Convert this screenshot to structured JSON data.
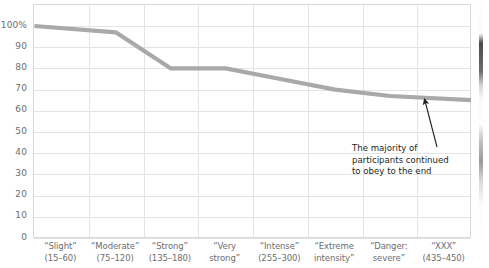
{
  "chart_data": {
    "type": "line",
    "title": "",
    "subtitle": "",
    "xlabel": "",
    "ylabel": "",
    "ylim": [
      0,
      100
    ],
    "grid": true,
    "legend_position": "none",
    "line_color": "#a9a9a9",
    "categories": [
      "“Slight” (15–60)",
      "“Moderate” (75–120)",
      "“Strong” (135–180)",
      "“Very strong”",
      "“Intense” (255–300)",
      "“Extreme intensity”",
      "“Danger: severe”",
      "“XXX” (435–450)"
    ],
    "values": [
      100,
      97,
      80,
      80,
      75,
      70,
      67,
      65
    ],
    "ytick_labels": [
      "100%",
      "90",
      "80",
      "70",
      "60",
      "50",
      "40",
      "30",
      "20",
      "10",
      "0"
    ],
    "ytick_values": [
      100,
      90,
      80,
      70,
      60,
      50,
      40,
      30,
      20,
      10,
      0
    ],
    "annotations": [
      {
        "name": "majority-obeyed-note",
        "lines": [
          "The majority of",
          "participants continued",
          "to obey to the end"
        ],
        "points_to_category": "“XXX” (435–450)",
        "points_to_value": 65
      }
    ]
  },
  "xaxis": {
    "categories": [
      {
        "line1": "“Slight”",
        "line2": "(15–60)"
      },
      {
        "line1": "“Moderate”",
        "line2": "(75–120)"
      },
      {
        "line1": "“Strong”",
        "line2": "(135–180)"
      },
      {
        "line1": "“Very",
        "line2": "strong”"
      },
      {
        "line1": "“Intense”",
        "line2": "(255–300)"
      },
      {
        "line1": "“Extreme",
        "line2": "intensity”"
      },
      {
        "line1": "“Danger:",
        "line2": "severe”"
      },
      {
        "line1": "“XXX”",
        "line2": "(435–450)"
      }
    ]
  },
  "yaxis": {
    "ticks": [
      "100%",
      "90",
      "80",
      "70",
      "60",
      "50",
      "40",
      "30",
      "20",
      "10",
      "0"
    ]
  },
  "annotation": {
    "line1": "The majority of",
    "line2": "participants continued",
    "line3": "to obey to the end"
  },
  "colors": {
    "series_line": "#a9a9a9",
    "gridline": "#e4e4e4",
    "plot_border": "#d9d9d9",
    "tick_text": "#6d6e71",
    "annotation_text": "#231f20"
  }
}
